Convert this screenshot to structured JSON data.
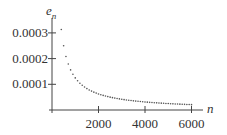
{
  "chart_data": {
    "type": "scatter",
    "title": "",
    "xlabel": "n",
    "ylabel": "e_n",
    "xlim": [
      0,
      6500
    ],
    "ylim": [
      0,
      0.00033
    ],
    "grid": false,
    "legend": null,
    "x_ticks": [
      2000,
      4000,
      6000
    ],
    "x_tick_labels": [
      "2000",
      "4000",
      "6000"
    ],
    "y_ticks": [
      0.0001,
      0.0002,
      0.0003
    ],
    "y_tick_labels": [
      "0.0001",
      "0.0002",
      "0.0003"
    ],
    "series": [
      {
        "name": "e_n",
        "x": [
          400,
          500,
          600,
          700,
          800,
          900,
          1000,
          1100,
          1200,
          1300,
          1400,
          1500,
          1600,
          1700,
          1800,
          1900,
          2000,
          2100,
          2200,
          2300,
          2400,
          2500,
          2600,
          2700,
          2800,
          2900,
          3000,
          3100,
          3200,
          3300,
          3400,
          3500,
          3600,
          3700,
          3800,
          3900,
          4000,
          4100,
          4200,
          4300,
          4400,
          4500,
          4600,
          4700,
          4800,
          4900,
          5000,
          5100,
          5200,
          5300,
          5400,
          5500,
          5600,
          5700,
          5800,
          5900,
          6000
        ],
        "y": [
          0.000313,
          0.00025,
          0.000208,
          0.000179,
          0.000156,
          0.000139,
          0.000125,
          0.000114,
          0.000104,
          9.62e-05,
          8.93e-05,
          8.33e-05,
          7.81e-05,
          7.35e-05,
          6.94e-05,
          6.58e-05,
          6.25e-05,
          5.95e-05,
          5.68e-05,
          5.43e-05,
          5.21e-05,
          5e-05,
          4.81e-05,
          4.63e-05,
          4.46e-05,
          4.31e-05,
          4.17e-05,
          4.03e-05,
          3.91e-05,
          3.79e-05,
          3.68e-05,
          3.57e-05,
          3.47e-05,
          3.38e-05,
          3.29e-05,
          3.21e-05,
          3.13e-05,
          3.05e-05,
          2.98e-05,
          2.91e-05,
          2.84e-05,
          2.78e-05,
          2.72e-05,
          2.66e-05,
          2.6e-05,
          2.55e-05,
          2.5e-05,
          2.45e-05,
          2.4e-05,
          2.36e-05,
          2.31e-05,
          2.27e-05,
          2.23e-05,
          2.19e-05,
          2.16e-05,
          2.12e-05,
          2.08e-05
        ]
      }
    ]
  },
  "labels": {
    "y_axis_name": "e",
    "y_axis_sub": "n",
    "x_axis_name": "n"
  }
}
